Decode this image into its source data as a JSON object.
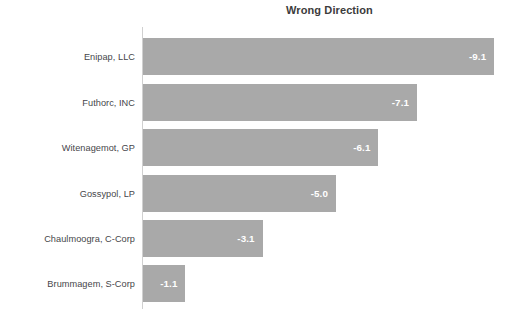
{
  "chart_data": {
    "type": "bar",
    "orientation": "horizontal",
    "title": "Wrong Direction",
    "xlabel": "",
    "ylabel": "",
    "grid": false,
    "legend": null,
    "xlim": [
      -10,
      0
    ],
    "categories": [
      "Enipap, LLC",
      "Futhorc, INC",
      "Witenagemot, GP",
      "Gossypol, LP",
      "Chaulmoogra, C-Corp",
      "Brummagem, S-Corp"
    ],
    "values": [
      -9.1,
      -7.1,
      -6.1,
      -5.0,
      -3.1,
      -1.1
    ],
    "value_labels": [
      "-9.1",
      "-7.1",
      "-6.1",
      "-5.0",
      "-3.1",
      "-1.1"
    ],
    "bars": [
      {
        "category": "Enipap, LLC",
        "value": -9.1,
        "label": "-9.1"
      },
      {
        "category": "Futhorc, INC",
        "value": -7.1,
        "label": "-7.1"
      },
      {
        "category": "Witenagemot, GP",
        "value": -6.1,
        "label": "-6.1"
      },
      {
        "category": "Gossypol, LP",
        "value": -5.0,
        "label": "-5.0"
      },
      {
        "category": "Chaulmoogra, C-Corp",
        "value": -3.1,
        "label": "-3.1"
      },
      {
        "category": "Brummagem, S-Corp",
        "value": -1.1,
        "label": "-1.1"
      }
    ],
    "colors": {
      "bar": "#a9a9a9",
      "value_label": "#ffffff",
      "category_label": "#46464a",
      "title": "#3c3c3c",
      "axis_line": "#d0d0d0",
      "background": "#ffffff"
    }
  }
}
